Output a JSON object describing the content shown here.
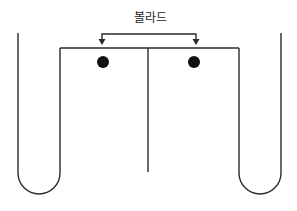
{
  "diagram": {
    "label": "볼라드",
    "colors": {
      "line": "#2a2a2a",
      "dot": "#111111",
      "background": "#ffffff"
    },
    "elements": {
      "bracket": {
        "y": 34,
        "x1": 102,
        "x2": 196,
        "arrow_tip_y": 44
      },
      "top_bar": {
        "y": 48,
        "x1": 60,
        "x2": 239
      },
      "center_divider": {
        "x": 148,
        "y1": 48,
        "y2": 172
      },
      "left_tube": {
        "outer_x": 18,
        "inner_x": 60,
        "top_outer": 33,
        "top_inner": 48,
        "bottom": 194
      },
      "right_tube": {
        "outer_x": 281,
        "inner_x": 239,
        "top_outer": 33,
        "top_inner": 48,
        "bottom": 194
      },
      "dots": [
        {
          "name": "left-bollard",
          "cx": 103,
          "cy": 62,
          "r": 6
        },
        {
          "name": "right-bollard",
          "cx": 194,
          "cy": 62,
          "r": 6
        }
      ]
    }
  }
}
